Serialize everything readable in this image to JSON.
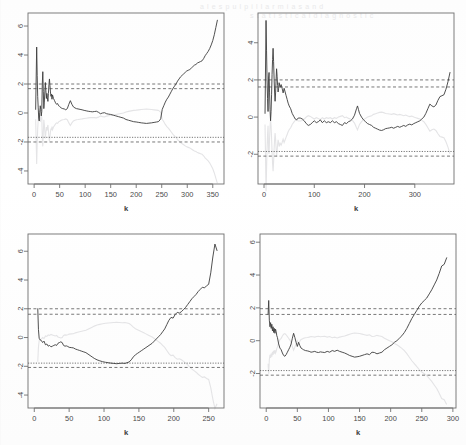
{
  "figure": {
    "kind": "multi-panel-diagnostic-plot",
    "layout": "2x2",
    "axis_title_x": "k",
    "axis_title_y": "",
    "line_color": "#3c3c3c",
    "band_color": "#555555",
    "ghost_color": "#e4e4e6",
    "box_color": "#6f6f6f",
    "bleed_text_top": "a l e s p u l p i l l a r m i a s a n d",
    "bleed_text_top2": "s t a t i s t i c a l   d i a g n o s t i c"
  },
  "chart_data": [
    {
      "id": "panel-top-left",
      "type": "line",
      "title": "",
      "xlabel": "k",
      "ylabel": "",
      "xlim": [
        -12,
        372
      ],
      "ylim": [
        -4.9,
        6.9
      ],
      "xticks": [
        0,
        50,
        100,
        150,
        200,
        250,
        300,
        350
      ],
      "yticks": [
        6,
        4,
        2,
        0,
        -2,
        -4
      ],
      "grid": false,
      "legend": false,
      "hlines": [
        {
          "y": 2.0,
          "style": "dashed",
          "label": "upper critical 2.0"
        },
        {
          "y": 1.68,
          "style": "dashed",
          "label": "upper critical 1.68"
        },
        {
          "y": -1.68,
          "style": "dotted",
          "label": "lower critical -1.68"
        },
        {
          "y": -2.0,
          "style": "dashed",
          "label": "lower critical -2.0"
        }
      ],
      "series": [
        {
          "name": "recursive statistic",
          "x": [
            3,
            5,
            6,
            7,
            8,
            9,
            10,
            11,
            12,
            13,
            14,
            15,
            16,
            17,
            18,
            19,
            20,
            21,
            22,
            23,
            24,
            25,
            26,
            27,
            28,
            29,
            30,
            31,
            32,
            33,
            34,
            35,
            36,
            38,
            40,
            42,
            44,
            46,
            48,
            50,
            53,
            56,
            59,
            62,
            65,
            68,
            71,
            74,
            77,
            80,
            83,
            86,
            90,
            94,
            98,
            102,
            106,
            110,
            114,
            118,
            122,
            126,
            130,
            134,
            138,
            142,
            146,
            150,
            155,
            160,
            165,
            170,
            175,
            180,
            185,
            190,
            195,
            200,
            205,
            210,
            215,
            220,
            225,
            230,
            235,
            240,
            243,
            245,
            248,
            251,
            254,
            257,
            260,
            263,
            266,
            269,
            272,
            275,
            278,
            281,
            284,
            287,
            290,
            293,
            296,
            299,
            302,
            305,
            308,
            311,
            314,
            317,
            320,
            323,
            326,
            329,
            332,
            335,
            338,
            341,
            344,
            347,
            350,
            353,
            356,
            359,
            362
          ],
          "y": [
            0.25,
            4.55,
            2.6,
            1.15,
            0.35,
            -0.35,
            -0.55,
            0.05,
            0.5,
            0.25,
            -0.2,
            0.1,
            2.0,
            2.85,
            1.5,
            0.3,
            0.75,
            1.45,
            2.1,
            1.55,
            1.0,
            1.35,
            1.05,
            0.8,
            1.35,
            1.95,
            2.35,
            1.9,
            1.45,
            1.15,
            1.3,
            0.95,
            1.25,
            1.0,
            0.85,
            0.7,
            0.6,
            0.65,
            0.5,
            0.45,
            0.35,
            0.3,
            0.28,
            0.22,
            0.3,
            0.6,
            0.85,
            0.6,
            0.42,
            0.35,
            0.3,
            0.28,
            0.25,
            0.22,
            0.18,
            0.15,
            0.12,
            0.1,
            0.08,
            0.1,
            0.12,
            0.05,
            -0.05,
            0.0,
            0.02,
            -0.05,
            -0.08,
            -0.1,
            -0.15,
            -0.2,
            -0.25,
            -0.3,
            -0.35,
            -0.45,
            -0.5,
            -0.55,
            -0.6,
            -0.62,
            -0.65,
            -0.68,
            -0.7,
            -0.72,
            -0.7,
            -0.68,
            -0.65,
            -0.62,
            -0.6,
            -0.55,
            -0.4,
            0.25,
            0.5,
            0.75,
            0.95,
            1.1,
            1.3,
            1.5,
            1.7,
            1.85,
            2.0,
            2.2,
            2.35,
            2.5,
            2.6,
            2.7,
            2.8,
            2.9,
            2.95,
            3.0,
            3.1,
            3.2,
            3.3,
            3.35,
            3.45,
            3.5,
            3.55,
            3.6,
            3.75,
            3.95,
            4.1,
            4.25,
            4.45,
            4.7,
            5.0,
            5.4,
            5.9,
            6.4
          ]
        }
      ]
    },
    {
      "id": "panel-top-right",
      "type": "line",
      "title": "",
      "xlabel": "k",
      "ylabel": "",
      "xlim": [
        -12,
        378
      ],
      "ylim": [
        -3.6,
        5.6
      ],
      "xticks": [
        0,
        100,
        200,
        300
      ],
      "yticks": [
        4,
        2,
        0,
        -2
      ],
      "grid": false,
      "legend": false,
      "hlines": [
        {
          "y": 2.0,
          "style": "dashed",
          "label": "upper critical 2.0"
        },
        {
          "y": 1.62,
          "style": "dashed",
          "label": "upper critical 1.62"
        },
        {
          "y": -1.85,
          "style": "dotted",
          "label": "lower critical -1.85"
        },
        {
          "y": -2.1,
          "style": "dashed",
          "label": "lower critical -2.1"
        }
      ],
      "series": [
        {
          "name": "recursive statistic",
          "x": [
            2,
            4,
            5,
            6,
            7,
            8,
            9,
            10,
            11,
            12,
            13,
            14,
            15,
            16,
            17,
            18,
            19,
            20,
            21,
            22,
            23,
            24,
            25,
            26,
            27,
            28,
            29,
            30,
            32,
            34,
            36,
            38,
            40,
            42,
            44,
            46,
            48,
            50,
            53,
            56,
            59,
            62,
            65,
            68,
            72,
            76,
            80,
            84,
            88,
            92,
            96,
            100,
            104,
            108,
            112,
            116,
            120,
            124,
            128,
            132,
            136,
            140,
            144,
            148,
            152,
            156,
            160,
            164,
            168,
            172,
            176,
            180,
            184,
            186,
            188,
            190,
            194,
            198,
            202,
            206,
            210,
            214,
            218,
            222,
            226,
            230,
            234,
            238,
            242,
            246,
            250,
            254,
            258,
            262,
            266,
            270,
            274,
            278,
            282,
            286,
            290,
            294,
            298,
            302,
            306,
            310,
            314,
            318,
            322,
            326,
            330,
            334,
            338,
            342,
            346,
            350,
            354,
            358,
            362,
            366,
            370
          ],
          "y": [
            0.2,
            5.2,
            3.6,
            2.0,
            1.0,
            0.3,
            2.1,
            2.4,
            1.3,
            0.4,
            -0.2,
            0.3,
            1.2,
            2.3,
            3.1,
            3.7,
            3.0,
            2.1,
            1.35,
            0.85,
            1.3,
            2.0,
            2.6,
            2.2,
            1.7,
            1.35,
            1.55,
            1.85,
            1.6,
            1.75,
            1.55,
            1.3,
            1.55,
            1.35,
            1.15,
            0.95,
            0.75,
            0.6,
            0.45,
            0.2,
            0.05,
            -0.1,
            -0.15,
            -0.05,
            -0.05,
            -0.1,
            -0.2,
            -0.35,
            -0.45,
            -0.4,
            -0.3,
            -0.2,
            -0.3,
            -0.25,
            -0.15,
            -0.3,
            -0.2,
            -0.3,
            -0.25,
            -0.3,
            -0.2,
            -0.3,
            -0.25,
            -0.35,
            -0.4,
            -0.45,
            -0.3,
            -0.35,
            -0.25,
            -0.2,
            -0.1,
            0.1,
            0.45,
            0.6,
            0.4,
            0.2,
            0.0,
            -0.15,
            -0.25,
            -0.35,
            -0.4,
            -0.45,
            -0.55,
            -0.6,
            -0.65,
            -0.7,
            -0.72,
            -0.68,
            -0.62,
            -0.6,
            -0.58,
            -0.55,
            -0.6,
            -0.55,
            -0.5,
            -0.55,
            -0.5,
            -0.45,
            -0.5,
            -0.42,
            -0.38,
            -0.42,
            -0.35,
            -0.3,
            -0.25,
            -0.2,
            -0.1,
            0.0,
            0.2,
            0.45,
            0.7,
            0.6,
            0.55,
            0.65,
            0.9,
            1.1,
            1.15,
            1.2,
            1.5,
            1.9,
            2.4,
            3.0,
            3.35
          ]
        }
      ]
    },
    {
      "id": "panel-bottom-left",
      "type": "line",
      "title": "",
      "xlabel": "k",
      "ylabel": "",
      "xlim": [
        -9,
        272
      ],
      "ylim": [
        -4.9,
        7.2
      ],
      "xticks": [
        0,
        50,
        100,
        150,
        200,
        250
      ],
      "yticks": [
        6,
        4,
        2,
        0,
        -2,
        -4
      ],
      "grid": false,
      "legend": false,
      "hlines": [
        {
          "y": 2.0,
          "style": "dashed",
          "label": "upper critical 2.0"
        },
        {
          "y": 1.62,
          "style": "dashed",
          "label": "upper critical 1.62"
        },
        {
          "y": -1.78,
          "style": "dotted",
          "label": "lower critical -1.78"
        },
        {
          "y": -2.08,
          "style": "dashed",
          "label": "lower critical -2.08"
        }
      ],
      "series": [
        {
          "name": "recursive statistic",
          "x": [
            5,
            6,
            7,
            8,
            10,
            12,
            14,
            16,
            18,
            20,
            22,
            24,
            26,
            28,
            30,
            32,
            34,
            36,
            38,
            40,
            42,
            44,
            46,
            48,
            50,
            53,
            56,
            59,
            62,
            65,
            68,
            71,
            74,
            77,
            80,
            83,
            86,
            90,
            94,
            98,
            102,
            106,
            110,
            114,
            118,
            122,
            126,
            130,
            133,
            136,
            139,
            142,
            145,
            148,
            151,
            154,
            157,
            160,
            163,
            166,
            169,
            172,
            175,
            178,
            181,
            184,
            187,
            190,
            193,
            196,
            199,
            202,
            205,
            208,
            211,
            214,
            217,
            220,
            223,
            226,
            229,
            232,
            235,
            238,
            241,
            244,
            247,
            250,
            253,
            256,
            259,
            262
          ],
          "y": [
            2.0,
            0.55,
            -0.05,
            -0.15,
            -0.2,
            -0.35,
            -0.25,
            -0.5,
            -0.45,
            -0.6,
            -0.55,
            -0.65,
            -0.6,
            -0.55,
            -0.5,
            -0.55,
            -0.4,
            -0.35,
            -0.3,
            -0.35,
            -0.55,
            -0.6,
            -0.58,
            -0.62,
            -0.68,
            -0.7,
            -0.72,
            -0.8,
            -0.85,
            -0.9,
            -0.95,
            -1.0,
            -1.05,
            -1.15,
            -1.25,
            -1.35,
            -1.45,
            -1.55,
            -1.62,
            -1.68,
            -1.72,
            -1.75,
            -1.78,
            -1.8,
            -1.82,
            -1.8,
            -1.78,
            -1.8,
            -1.75,
            -1.7,
            -1.55,
            -1.35,
            -1.2,
            -1.1,
            -1.0,
            -0.9,
            -0.8,
            -0.7,
            -0.6,
            -0.5,
            -0.4,
            -0.25,
            -0.1,
            0.05,
            0.2,
            0.4,
            0.6,
            0.9,
            1.2,
            1.4,
            1.35,
            1.6,
            1.75,
            1.7,
            1.8,
            1.95,
            2.1,
            2.3,
            2.5,
            2.7,
            2.85,
            3.0,
            3.2,
            3.35,
            3.5,
            3.45,
            3.6,
            3.7,
            4.5,
            5.6,
            6.5,
            6.05
          ]
        }
      ]
    },
    {
      "id": "panel-bottom-right",
      "type": "line",
      "title": "",
      "xlabel": "k",
      "ylabel": "",
      "xlim": [
        -10,
        305
      ],
      "ylim": [
        -4.1,
        6.5
      ],
      "xticks": [
        0,
        50,
        100,
        150,
        200,
        250,
        300
      ],
      "yticks": [
        6,
        4,
        2,
        0,
        -2
      ],
      "grid": false,
      "legend": false,
      "hlines": [
        {
          "y": 1.95,
          "style": "dashed",
          "label": "upper critical 1.95"
        },
        {
          "y": 1.6,
          "style": "dashed",
          "label": "upper critical 1.6"
        },
        {
          "y": -1.82,
          "style": "dotted",
          "label": "lower critical -1.82"
        },
        {
          "y": -2.1,
          "style": "dashed",
          "label": "lower critical -2.1"
        }
      ],
      "series": [
        {
          "name": "recursive statistic",
          "x": [
            3,
            4,
            5,
            6,
            7,
            8,
            9,
            10,
            11,
            12,
            13,
            14,
            15,
            16,
            17,
            18,
            20,
            22,
            24,
            26,
            28,
            30,
            32,
            34,
            36,
            38,
            40,
            42,
            44,
            46,
            48,
            50,
            52,
            54,
            56,
            58,
            60,
            63,
            66,
            69,
            72,
            75,
            78,
            81,
            84,
            87,
            90,
            94,
            98,
            102,
            106,
            110,
            114,
            118,
            122,
            126,
            130,
            134,
            138,
            142,
            146,
            150,
            154,
            158,
            162,
            166,
            170,
            174,
            178,
            182,
            186,
            190,
            194,
            198,
            202,
            206,
            210,
            214,
            218,
            222,
            226,
            230,
            234,
            238,
            242,
            246,
            250,
            254,
            258,
            262,
            266,
            270,
            274,
            278,
            282,
            286,
            290
          ],
          "y": [
            1.6,
            2.45,
            1.25,
            0.85,
            1.1,
            0.75,
            1.0,
            0.6,
            0.85,
            0.5,
            0.75,
            0.45,
            0.7,
            0.55,
            0.3,
            0.2,
            -0.2,
            -0.45,
            -0.55,
            -0.75,
            -0.9,
            -0.95,
            -0.85,
            -0.7,
            -0.55,
            -0.4,
            -0.2,
            0.15,
            0.45,
            0.2,
            -0.1,
            -0.35,
            -0.1,
            -0.3,
            -0.45,
            -0.5,
            -0.55,
            -0.6,
            -0.62,
            -0.65,
            -0.7,
            -0.68,
            -0.65,
            -0.7,
            -0.72,
            -0.68,
            -0.7,
            -0.72,
            -0.65,
            -0.7,
            -0.6,
            -0.65,
            -0.58,
            -0.65,
            -0.7,
            -0.75,
            -0.82,
            -0.9,
            -0.95,
            -1.0,
            -0.98,
            -0.95,
            -0.9,
            -0.85,
            -0.8,
            -0.85,
            -0.7,
            -0.72,
            -0.8,
            -0.75,
            -0.7,
            -0.55,
            -0.45,
            -0.35,
            -0.25,
            -0.1,
            0.0,
            0.15,
            0.3,
            0.5,
            0.75,
            1.05,
            1.35,
            1.6,
            1.85,
            2.1,
            2.3,
            2.45,
            2.6,
            2.85,
            3.1,
            3.4,
            3.7,
            4.1,
            4.55,
            4.65,
            5.05,
            5.7
          ]
        }
      ]
    }
  ]
}
